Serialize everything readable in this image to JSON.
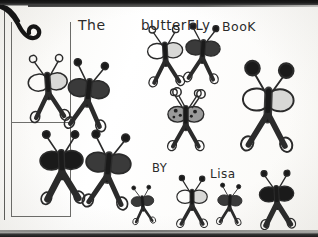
{
  "page": {
    "kind": "scanned-childs-drawing",
    "width": 318,
    "height": 237,
    "paper_color": "#fdfdfb",
    "ink_color": "#2b2b2b",
    "fill_color": "#1a1a1a"
  },
  "title": {
    "word_the": "The",
    "word_butterfly": "bUtterFLy",
    "word_book": "BooK",
    "full_text": "The bUtterFLy BooK"
  },
  "byline": {
    "by_label": "BY",
    "author": "Lisa"
  },
  "frame": {
    "top_band": "top-scan-band",
    "bottom_band": "bottom-scan-band",
    "left_margin": "binding-margin-strip",
    "corner_mark": "ink-hook-swoosh"
  },
  "butterflies": [
    {
      "id": "bf-1",
      "name": "butterfly-upper-left-outline",
      "x": 48,
      "y": 86,
      "scale": 1.0,
      "wing_style": "half-filled",
      "antenna_style": "ring",
      "rotate": -4
    },
    {
      "id": "bf-2",
      "name": "butterfly-upper-left-shaded",
      "x": 88,
      "y": 93,
      "scale": 1.05,
      "wing_style": "shaded",
      "antenna_style": "dot",
      "rotate": 6
    },
    {
      "id": "bf-3",
      "name": "butterfly-top-center-left",
      "x": 165,
      "y": 54,
      "scale": 0.9,
      "wing_style": "half-filled",
      "antenna_style": "ring",
      "rotate": -3
    },
    {
      "id": "bf-4",
      "name": "butterfly-top-center-right",
      "x": 203,
      "y": 52,
      "scale": 0.88,
      "wing_style": "shaded",
      "antenna_style": "dot",
      "rotate": 4
    },
    {
      "id": "bf-5",
      "name": "butterfly-center-patterned",
      "x": 186,
      "y": 118,
      "scale": 0.92,
      "wing_style": "spotted",
      "antenna_style": "ring",
      "rotate": 0
    },
    {
      "id": "bf-6",
      "name": "butterfly-right-large",
      "x": 268,
      "y": 105,
      "scale": 1.3,
      "wing_style": "half-filled",
      "antenna_style": "bigdot",
      "rotate": 2
    },
    {
      "id": "bf-7",
      "name": "butterfly-lower-left-dark",
      "x": 62,
      "y": 165,
      "scale": 1.1,
      "wing_style": "solid",
      "antenna_style": "dot",
      "rotate": -2
    },
    {
      "id": "bf-8",
      "name": "butterfly-lower-left-mid",
      "x": 108,
      "y": 168,
      "scale": 1.15,
      "wing_style": "shaded",
      "antenna_style": "dot",
      "rotate": 5
    },
    {
      "id": "bf-9",
      "name": "butterfly-small-bottom-left",
      "x": 143,
      "y": 203,
      "scale": 0.58,
      "wing_style": "shaded",
      "antenna_style": "dot",
      "rotate": -5
    },
    {
      "id": "bf-10",
      "name": "butterfly-bottom-center",
      "x": 192,
      "y": 200,
      "scale": 0.78,
      "wing_style": "half-filled",
      "antenna_style": "dot",
      "rotate": 0
    },
    {
      "id": "bf-11",
      "name": "butterfly-bottom-small-right",
      "x": 230,
      "y": 203,
      "scale": 0.62,
      "wing_style": "shaded",
      "antenna_style": "dot",
      "rotate": 3
    },
    {
      "id": "bf-12",
      "name": "butterfly-bottom-right-dark",
      "x": 277,
      "y": 198,
      "scale": 0.88,
      "wing_style": "solid",
      "antenna_style": "dot",
      "rotate": -3
    }
  ],
  "stray_marks": [
    {
      "name": "stray-antenna-upper-center",
      "x": 176,
      "y": 92
    },
    {
      "name": "stray-antenna-upper-right",
      "x": 204,
      "y": 94
    }
  ]
}
